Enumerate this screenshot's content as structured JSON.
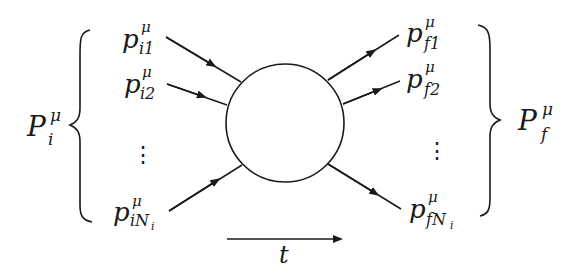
{
  "diagram": {
    "initial_group": {
      "label_main": "P",
      "label_sub": "i",
      "label_sup": "μ"
    },
    "final_group": {
      "label_main": "P",
      "label_sub": "f",
      "label_sup": "μ"
    },
    "incoming": [
      {
        "main": "p",
        "sup": "μ",
        "sub": "i1"
      },
      {
        "main": "p",
        "sup": "μ",
        "sub": "i2"
      },
      {
        "main": "p",
        "sup": "μ",
        "sub": "iN",
        "subsub": "i"
      }
    ],
    "outgoing": [
      {
        "main": "p",
        "sup": "μ",
        "sub": "f1"
      },
      {
        "main": "p",
        "sup": "μ",
        "sub": "f2"
      },
      {
        "main": "p",
        "sup": "μ",
        "sub": "fN",
        "subsub": "i"
      }
    ],
    "ellipsis": "⋮",
    "time_axis": {
      "label": "t"
    },
    "colors": {
      "stroke": "#1a1a1a",
      "background": "#ffffff"
    }
  }
}
